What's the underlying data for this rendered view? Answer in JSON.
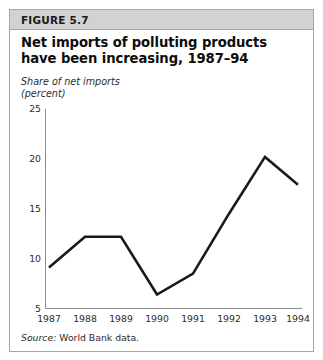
{
  "figure": {
    "label": "FIGURE 5.7",
    "title": "Net imports of polluting products have been increasing, 1987–94",
    "axis_caption": "Share of net imports\n(percent)",
    "source_key": "Source:",
    "source_text": " World Bank data."
  },
  "colors": {
    "header_band": "#d2d2d2",
    "frame_border": "#a6a6a6",
    "line": "#1a1a1a",
    "axis": "#8c8c8c",
    "text": "#1a1a1a"
  },
  "chart_data": {
    "type": "line",
    "title": "Net imports of polluting products have been increasing, 1987–94",
    "subtitle": "",
    "xlabel": "",
    "ylabel": "Share of net imports (percent)",
    "categories": [
      "1987",
      "1988",
      "1989",
      "1990",
      "1991",
      "1992",
      "1993",
      "1994"
    ],
    "x": [
      1987,
      1988,
      1989,
      1990,
      1991,
      1992,
      1993,
      1994
    ],
    "values": [
      9.1,
      12.2,
      12.2,
      6.4,
      8.5,
      14.5,
      20.2,
      17.4
    ],
    "series": [
      {
        "name": "Net imports of polluting products",
        "values": [
          9.1,
          12.2,
          12.2,
          6.4,
          8.5,
          14.5,
          20.2,
          17.4
        ]
      }
    ],
    "ylim": [
      5,
      25
    ],
    "yticks": [
      5,
      10,
      15,
      20,
      25
    ],
    "ytick_labels": [
      "5",
      "10",
      "15",
      "20",
      "25"
    ],
    "xtick_labels": [
      "1987",
      "1988",
      "1989",
      "1990",
      "1991",
      "1992",
      "1993",
      "1994"
    ],
    "grid": false,
    "legend": false,
    "legend_position": "none",
    "source": "Source: World Bank data."
  }
}
